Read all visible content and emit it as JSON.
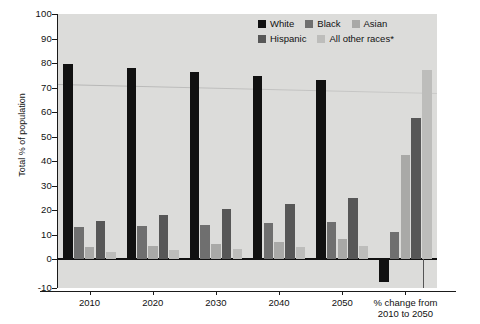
{
  "chart_data": {
    "type": "bar",
    "title": "",
    "xlabel": "",
    "ylabel": "Total % of population",
    "ylim": [
      -10,
      100
    ],
    "yticks": [
      100,
      90,
      80,
      70,
      60,
      50,
      40,
      30,
      20,
      10,
      0,
      -10
    ],
    "grid": false,
    "legend_position": "top-right",
    "categories": [
      "2010",
      "2020",
      "2030",
      "2040",
      "2050",
      "% change from\n2010 to 2050"
    ],
    "category_labels": [
      {
        "line1": "2010",
        "line2": ""
      },
      {
        "line1": "2020",
        "line2": ""
      },
      {
        "line1": "2030",
        "line2": ""
      },
      {
        "line1": "2040",
        "line2": ""
      },
      {
        "line1": "2050",
        "line2": ""
      },
      {
        "line1": "% change from",
        "line2": "2010 to 2050"
      }
    ],
    "series": [
      {
        "name": "White",
        "color": "#111111",
        "values": [
          79.5,
          78.0,
          76.5,
          74.5,
          73.0,
          -8.0
        ]
      },
      {
        "name": "Black",
        "color": "#6f6f6f",
        "values": [
          13.0,
          13.5,
          14.0,
          14.7,
          15.0,
          11.0
        ]
      },
      {
        "name": "Asian",
        "color": "#a9a9a7",
        "values": [
          4.7,
          5.5,
          6.2,
          7.0,
          8.0,
          42.5
        ]
      },
      {
        "name": "Hispanic",
        "color": "#575757",
        "values": [
          15.5,
          17.8,
          20.3,
          22.3,
          24.8,
          57.5
        ]
      },
      {
        "name": "All other races*",
        "color": "#bdbdbb",
        "values": [
          2.8,
          3.5,
          4.2,
          4.8,
          5.5,
          77.0
        ]
      }
    ]
  },
  "axis": {
    "y_label": "Total % of population",
    "y_ticks": [
      "100",
      "90",
      "80",
      "70",
      "60",
      "50",
      "40",
      "30",
      "20",
      "10",
      "0",
      "-10"
    ]
  },
  "legend": {
    "row1": [
      {
        "label": "White",
        "swatch": "sw-white"
      },
      {
        "label": "Black",
        "swatch": "sw-black"
      },
      {
        "label": "Asian",
        "swatch": "sw-asian"
      }
    ],
    "row2": [
      {
        "label": "Hispanic",
        "swatch": "sw-hispanic"
      },
      {
        "label": "All other races*",
        "swatch": "sw-other"
      }
    ]
  }
}
